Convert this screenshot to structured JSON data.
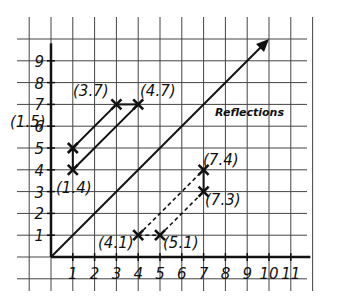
{
  "title": "Reflections",
  "colors": {
    "ink": "#111111",
    "grid": "#333333",
    "background": "#ffffff"
  },
  "chart_data": {
    "type": "scatter",
    "title": "Reflections",
    "xlabel": "",
    "ylabel": "",
    "x_ticks": [
      "1",
      "2",
      "3",
      "4",
      "5",
      "6",
      "7",
      "8",
      "9",
      "10",
      "11"
    ],
    "y_ticks": [
      "1",
      "2",
      "3",
      "4",
      "5",
      "6",
      "7",
      "8",
      "9"
    ],
    "xlim": [
      -1,
      12
    ],
    "ylim": [
      -1,
      10
    ],
    "grid": true,
    "mirror_line": {
      "from": [
        0,
        0
      ],
      "to": [
        10,
        10
      ],
      "style": "solid",
      "arrow": true,
      "label": "y = x"
    },
    "points": [
      {
        "label": "(1,5)",
        "x": 1,
        "y": 5
      },
      {
        "label": "(3,7)",
        "x": 3,
        "y": 7
      },
      {
        "label": "(4,7)",
        "x": 4,
        "y": 7
      },
      {
        "label": "(1,4)",
        "x": 1,
        "y": 4
      },
      {
        "label": "(7,4)",
        "x": 7,
        "y": 4
      },
      {
        "label": "(7,3)",
        "x": 7,
        "y": 3
      },
      {
        "label": "(4,1)",
        "x": 4,
        "y": 1
      },
      {
        "label": "(5,1)",
        "x": 5,
        "y": 1
      }
    ],
    "segments": [
      {
        "from": "(1,5)",
        "to": "(3,7)",
        "style": "solid"
      },
      {
        "from": "(3,7)",
        "to": "(4,7)",
        "style": "solid"
      },
      {
        "from": "(1,4)",
        "to": "(4,7)",
        "style": "solid"
      },
      {
        "from": "(1,4)",
        "to": "(1,5)",
        "style": "solid"
      },
      {
        "from": "(4,1)",
        "to": "(7,4)",
        "style": "dashed"
      },
      {
        "from": "(4,1)",
        "to": "(5,1)",
        "style": "dashed"
      },
      {
        "from": "(5,1)",
        "to": "(7,3)",
        "style": "dashed"
      },
      {
        "from": "(7,3)",
        "to": "(7,4)",
        "style": "solid"
      }
    ]
  },
  "labels": {
    "p15": "(1.5)",
    "p37": "(3.7)",
    "p47": "(4.7)",
    "p14": "(1.4)",
    "p74": "(7.4)",
    "p73": "(7.3)",
    "p41": "(4.1)",
    "p51": "(5.1)"
  },
  "ticks": {
    "x": [
      "1",
      "2",
      "3",
      "4",
      "5",
      "6",
      "7",
      "8",
      "9",
      "10",
      "11"
    ],
    "y": [
      "1",
      "2",
      "3",
      "4",
      "5",
      "6",
      "7",
      "8",
      "9"
    ]
  }
}
